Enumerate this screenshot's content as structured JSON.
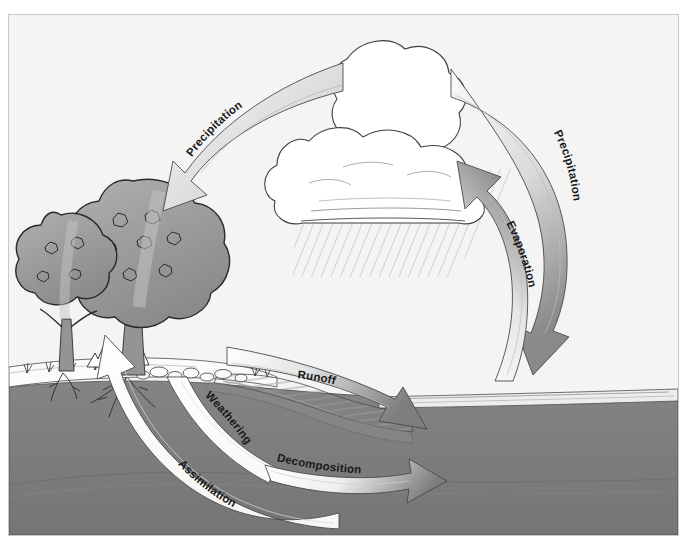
{
  "figure": {
    "palette": {
      "background": "#f4f4f4",
      "sky": "#f4f4f4",
      "frame_border": "#c9c9c9",
      "soil": "#7c7c7c",
      "soil_dark": "#6b6b6b",
      "ground_surface": "#fdfdfd",
      "water": "#b9b9b9",
      "tree_canopy": "#9a9a9a",
      "tree_canopy_light": "#b3b3b3",
      "trunk": "#8e8e8e",
      "cloud": "#ffffff",
      "outline": "#3a3a3a",
      "arrow_dark": "#808080",
      "arrow_light": "#fbfbfb",
      "rain": "#b5b5b5",
      "label_text": "#1a1a1a"
    },
    "arrows": [
      {
        "id": "precipitation-left",
        "label": "Precipitation",
        "style": "light-to-dark",
        "direction": "cloud-to-forest",
        "from": "cloud",
        "to": "tree-canopy"
      },
      {
        "id": "precipitation-right",
        "label": "Precipitation",
        "style": "light-to-dark",
        "direction": "cloud-to-water",
        "from": "cloud",
        "to": "water-surface"
      },
      {
        "id": "evaporation",
        "label": "Evaporation",
        "style": "light-to-dark",
        "direction": "water-to-cloud",
        "from": "water-surface",
        "to": "cloud"
      },
      {
        "id": "runoff",
        "label": "Runoff",
        "style": "light-to-dark",
        "direction": "land-to-water",
        "from": "stream-bank",
        "to": "water-body"
      },
      {
        "id": "weathering",
        "label": "Weathering",
        "style": "light",
        "direction": "subsurface-upward",
        "from": "subsurface",
        "to": "stream-bank"
      },
      {
        "id": "decomposition",
        "label": "Decomposition",
        "style": "light-to-dark",
        "direction": "subsurface-to-water",
        "from": "subsurface",
        "to": "water-body"
      },
      {
        "id": "assimilation",
        "label": "Assimilation",
        "style": "light",
        "direction": "soil-to-tree",
        "from": "deep-soil",
        "to": "tree-roots"
      }
    ],
    "scene_elements": [
      {
        "id": "cumulonimbus-cloud",
        "name": "storm cloud"
      },
      {
        "id": "rain-shaft",
        "name": "falling rain"
      },
      {
        "id": "deciduous-tree-large",
        "name": "large broadleaf tree"
      },
      {
        "id": "deciduous-tree-small",
        "name": "smaller broadleaf tree"
      },
      {
        "id": "conifer-shrubs",
        "name": "conifer saplings"
      },
      {
        "id": "grass-tufts",
        "name": "grass"
      },
      {
        "id": "rocks",
        "name": "rocks along bank"
      },
      {
        "id": "stream",
        "name": "stream channel"
      },
      {
        "id": "water-body",
        "name": "lake / ocean"
      },
      {
        "id": "soil-cross-section",
        "name": "soil cross section"
      },
      {
        "id": "tree-roots",
        "name": "root system"
      }
    ]
  }
}
